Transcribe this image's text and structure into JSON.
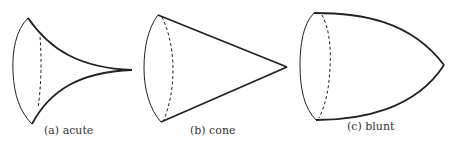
{
  "figures": [
    {
      "id": "a",
      "caption": "(a) acute",
      "shape": "acute"
    },
    {
      "id": "b",
      "caption": "(b) cone",
      "shape": "cone"
    },
    {
      "id": "c",
      "caption": "(c) blunt",
      "shape": "blunt"
    }
  ],
  "colors": {
    "stroke": "#222222",
    "background": "#ffffff"
  }
}
